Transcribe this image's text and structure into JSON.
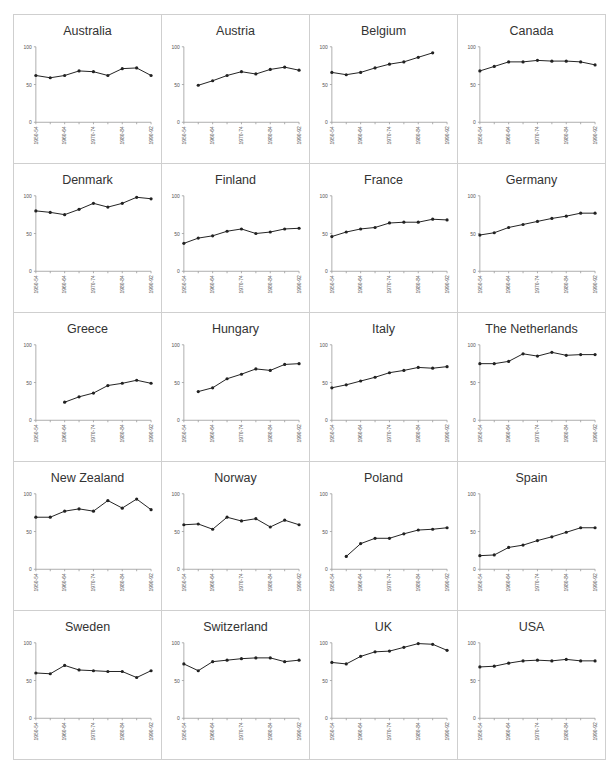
{
  "chart_data": {
    "type": "line",
    "layout": "small-multiples grid, 5 rows x 4 columns",
    "categories": [
      "1950-54",
      "1955-59",
      "1960-64",
      "1965-69",
      "1970-74",
      "1975-79",
      "1980-84",
      "1985-89",
      "1990-92"
    ],
    "tick_labels": [
      "1950-54",
      "1960-64",
      "1970-74",
      "1980-84",
      "1990-92"
    ],
    "tick_label_indices": [
      0,
      2,
      4,
      6,
      8
    ],
    "ylim": [
      0,
      100
    ],
    "yticks": [
      0,
      50,
      100
    ],
    "grid": false,
    "legend": "none",
    "xlabel": "",
    "ylabel": "",
    "panels": [
      {
        "title": "Australia",
        "values": [
          62,
          59,
          62,
          68,
          67,
          62,
          71,
          72,
          62
        ]
      },
      {
        "title": "Austria",
        "values": [
          null,
          49,
          55,
          62,
          67,
          64,
          70,
          73,
          69
        ]
      },
      {
        "title": "Belgium",
        "values": [
          66,
          63,
          66,
          72,
          77,
          80,
          86,
          92,
          null
        ]
      },
      {
        "title": "Canada",
        "values": [
          68,
          74,
          80,
          80,
          82,
          81,
          81,
          80,
          76
        ]
      },
      {
        "title": "Denmark",
        "values": [
          80,
          78,
          75,
          82,
          90,
          85,
          90,
          98,
          96
        ]
      },
      {
        "title": "Finland",
        "values": [
          37,
          44,
          47,
          53,
          56,
          50,
          52,
          56,
          57
        ]
      },
      {
        "title": "France",
        "values": [
          46,
          52,
          56,
          58,
          64,
          65,
          65,
          69,
          68
        ]
      },
      {
        "title": "Germany",
        "values": [
          48,
          51,
          58,
          62,
          66,
          70,
          73,
          77,
          77
        ]
      },
      {
        "title": "Greece",
        "values": [
          null,
          null,
          24,
          31,
          36,
          46,
          49,
          53,
          49
        ]
      },
      {
        "title": "Hungary",
        "values": [
          null,
          38,
          43,
          55,
          61,
          68,
          66,
          74,
          75
        ]
      },
      {
        "title": "Italy",
        "values": [
          43,
          47,
          52,
          57,
          63,
          66,
          70,
          69,
          71
        ]
      },
      {
        "title": "The Netherlands",
        "values": [
          75,
          75,
          78,
          88,
          85,
          90,
          86,
          87,
          87
        ]
      },
      {
        "title": "New Zealand",
        "values": [
          69,
          69,
          77,
          80,
          77,
          91,
          81,
          93,
          79
        ]
      },
      {
        "title": "Norway",
        "values": [
          59,
          60,
          53,
          69,
          64,
          67,
          56,
          65,
          59
        ]
      },
      {
        "title": "Poland",
        "values": [
          null,
          17,
          34,
          41,
          41,
          47,
          52,
          53,
          55
        ]
      },
      {
        "title": "Spain",
        "values": [
          18,
          19,
          29,
          32,
          38,
          43,
          49,
          55,
          55
        ]
      },
      {
        "title": "Sweden",
        "values": [
          60,
          59,
          70,
          64,
          63,
          62,
          62,
          54,
          63
        ]
      },
      {
        "title": "Switzerland",
        "values": [
          72,
          63,
          75,
          77,
          79,
          80,
          80,
          75,
          77
        ]
      },
      {
        "title": "UK",
        "values": [
          74,
          72,
          82,
          88,
          89,
          94,
          99,
          98,
          90
        ]
      },
      {
        "title": "USA",
        "values": [
          68,
          69,
          73,
          76,
          77,
          76,
          78,
          76,
          76
        ]
      }
    ]
  },
  "style": {
    "line_color": "#222222",
    "axis_color": "#9a9a9a",
    "border_color": "#cfcfcf",
    "tick_label_color": "#555555"
  }
}
